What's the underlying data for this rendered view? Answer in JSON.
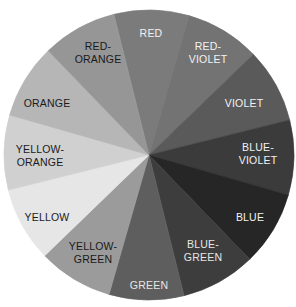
{
  "diagram": {
    "type": "color-wheel",
    "rendering": "grayscale",
    "center": [
      149,
      155
    ],
    "radius": 145,
    "start_angle_deg": -14,
    "segments": [
      {
        "name": "RED",
        "lines": [
          "RED"
        ],
        "fill": "#7b7b7b",
        "text_color": "#f2f2f2",
        "label_pos": [
          151,
          33
        ]
      },
      {
        "name": "RED-VIOLET",
        "lines": [
          "RED-",
          "VIOLET"
        ],
        "fill": "#737373",
        "text_color": "#f2f2f2",
        "label_pos": [
          208,
          52
        ]
      },
      {
        "name": "VIOLET",
        "lines": [
          "VIOLET"
        ],
        "fill": "#5a5a5a",
        "text_color": "#f2f2f2",
        "label_pos": [
          244,
          103
        ]
      },
      {
        "name": "BLUE-VIOLET",
        "lines": [
          "BLUE-",
          "VIOLET"
        ],
        "fill": "#3b3b3b",
        "text_color": "#f2f2f2",
        "label_pos": [
          258,
          153
        ]
      },
      {
        "name": "BLUE",
        "lines": [
          "BLUE"
        ],
        "fill": "#262626",
        "text_color": "#f2f2f2",
        "label_pos": [
          250,
          217
        ]
      },
      {
        "name": "BLUE-GREEN",
        "lines": [
          "BLUE-",
          "GREEN"
        ],
        "fill": "#3d3d3d",
        "text_color": "#e6e6e6",
        "label_pos": [
          203,
          250
        ]
      },
      {
        "name": "GREEN",
        "lines": [
          "GREEN"
        ],
        "fill": "#5e5e5e",
        "text_color": "#e6e6e6",
        "label_pos": [
          149,
          285
        ]
      },
      {
        "name": "YELLOW-GREEN",
        "lines": [
          "YELLOW-",
          "GREEN"
        ],
        "fill": "#9b9b9b",
        "text_color": "#1a1a1a",
        "label_pos": [
          93,
          252
        ]
      },
      {
        "name": "YELLOW",
        "lines": [
          "YELLOW"
        ],
        "fill": "#e6e6e6",
        "text_color": "#1a1a1a",
        "label_pos": [
          47,
          217
        ]
      },
      {
        "name": "YELLOW-ORANGE",
        "lines": [
          "YELLOW-",
          "ORANGE"
        ],
        "fill": "#d0d0d0",
        "text_color": "#1a1a1a",
        "label_pos": [
          40,
          155
        ]
      },
      {
        "name": "ORANGE",
        "lines": [
          "ORANGE"
        ],
        "fill": "#b6b6b6",
        "text_color": "#1a1a1a",
        "label_pos": [
          47,
          103
        ]
      },
      {
        "name": "RED-ORANGE",
        "lines": [
          "RED-",
          "ORANGE"
        ],
        "fill": "#969696",
        "text_color": "#1a1a1a",
        "label_pos": [
          98,
          52
        ]
      }
    ]
  }
}
